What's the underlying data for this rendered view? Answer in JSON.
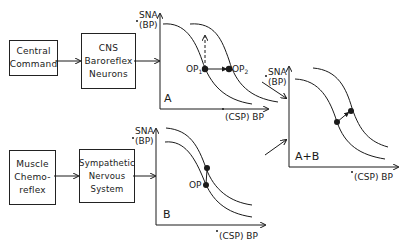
{
  "boxes": {
    "central_command": {
      "lines": [
        "Central",
        "Command"
      ]
    },
    "cns_baroreflex": {
      "lines": [
        "CNS",
        "Baroreflex",
        "Neurons"
      ]
    },
    "muscle_chemoreflex": {
      "lines": [
        "Muscle",
        "Chemo-",
        "reflex"
      ]
    },
    "sympathetic": {
      "lines": [
        "Sympathetic",
        "Nervous",
        "System"
      ]
    }
  },
  "panels": {
    "A": {
      "letter": "A",
      "y_label_1": "SNA",
      "y_label_2": "(BP)",
      "x_label": "(CSP)  BP",
      "op1": "OP",
      "op1_sub": "1",
      "op2": "OP",
      "op2_sub": "2"
    },
    "B": {
      "letter": "B",
      "y_label_1": "SNA",
      "y_label_2": "(BP)",
      "x_label": "(CSP)  BP",
      "op": "OP"
    },
    "AB": {
      "letter": "A+B",
      "y_label_1": "SNA",
      "y_label_2": "(BP)",
      "x_label": "(CSP)  BP"
    }
  },
  "colors": {
    "ink": "#1a1a1a",
    "background": "#ffffff"
  }
}
